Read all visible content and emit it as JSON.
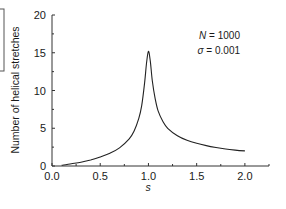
{
  "chart_data": {
    "type": "line",
    "title": "",
    "xlabel": "s",
    "ylabel": "Number of helical stretches",
    "xlim": [
      0.0,
      2.25
    ],
    "ylim": [
      0,
      20
    ],
    "xticks": [
      0.0,
      0.5,
      1.0,
      1.5,
      2.0
    ],
    "xtick_labels": [
      "0.0",
      "0.5",
      "1.0",
      "1.5",
      "2.0"
    ],
    "xminor_ticks": [
      0.25,
      0.75,
      1.25,
      1.75,
      2.25
    ],
    "yticks": [
      0,
      5,
      10,
      15,
      20
    ],
    "ytick_labels": [
      "0",
      "5",
      "10",
      "15",
      "20"
    ],
    "yminor_ticks": [
      2.5,
      7.5,
      12.5,
      17.5
    ],
    "grid": false,
    "legend": null,
    "annotations": [
      {
        "text_var": "N",
        "text_val": " = 1000"
      },
      {
        "text_var": "σ",
        "text_val": " = 0.001"
      }
    ],
    "series": [
      {
        "name": "helical stretches",
        "x": [
          0.1,
          0.2,
          0.3,
          0.4,
          0.5,
          0.6,
          0.7,
          0.8,
          0.85,
          0.9,
          0.93,
          0.96,
          0.98,
          1.0,
          1.02,
          1.04,
          1.07,
          1.1,
          1.15,
          1.2,
          1.3,
          1.4,
          1.5,
          1.6,
          1.7,
          1.8,
          1.9,
          2.0
        ],
        "values": [
          0.1,
          0.3,
          0.5,
          0.8,
          1.2,
          1.7,
          2.4,
          3.6,
          4.6,
          6.3,
          8.0,
          11.0,
          13.6,
          15.2,
          13.8,
          11.3,
          8.9,
          7.3,
          5.9,
          5.0,
          4.0,
          3.4,
          3.0,
          2.7,
          2.45,
          2.25,
          2.1,
          2.0
        ]
      }
    ]
  }
}
